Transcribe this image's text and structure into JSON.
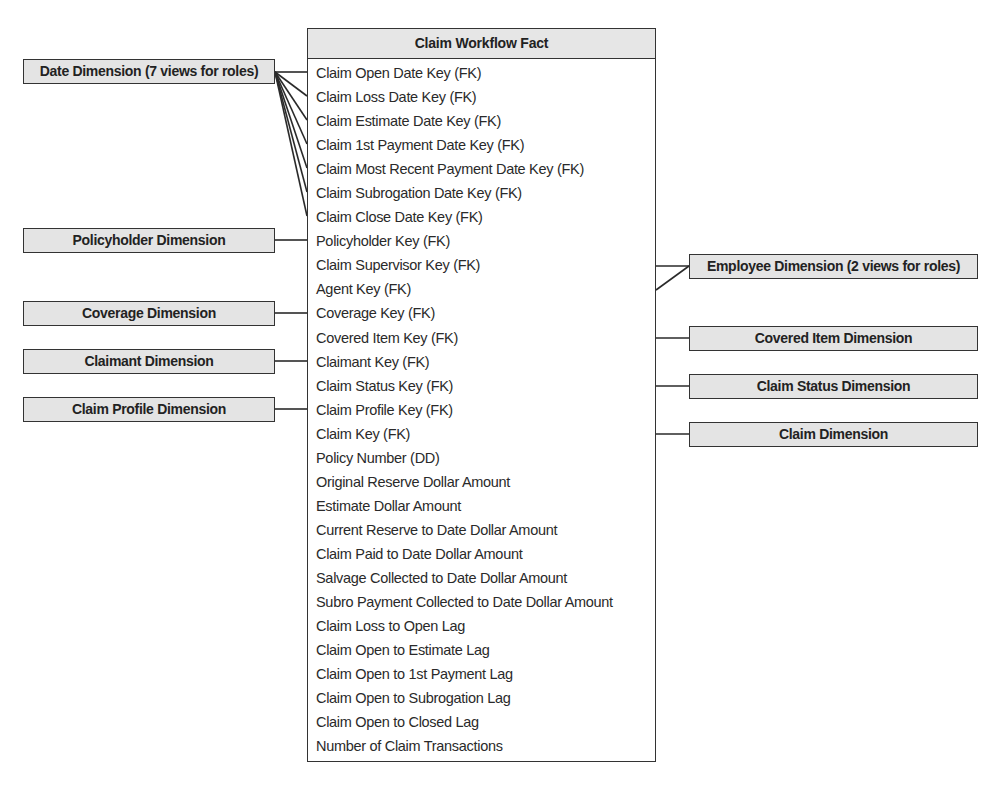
{
  "fact_table": {
    "title": "Claim Workflow Fact",
    "rows": [
      "Claim Open Date Key (FK)",
      "Claim Loss Date Key (FK)",
      "Claim Estimate Date Key (FK)",
      "Claim 1st Payment Date Key (FK)",
      "Claim Most Recent Payment Date Key (FK)",
      "Claim Subrogation Date Key (FK)",
      "Claim Close Date Key (FK)",
      "Policyholder Key (FK)",
      "Claim Supervisor Key (FK)",
      "Agent Key (FK)",
      "Coverage Key (FK)",
      "Covered Item Key (FK)",
      "Claimant Key (FK)",
      "Claim Status Key (FK)",
      "Claim Profile Key (FK)",
      "Claim Key (FK)",
      "Policy Number (DD)",
      "Original Reserve Dollar Amount",
      "Estimate Dollar Amount",
      "Current Reserve to Date Dollar Amount",
      "Claim Paid to Date Dollar Amount",
      "Salvage Collected to Date Dollar Amount",
      "Subro Payment Collected to Date Dollar Amount",
      "Claim Loss to Open Lag",
      "Claim Open to Estimate Lag",
      "Claim Open to 1st Payment Lag",
      "Claim Open to Subrogation Lag",
      "Claim Open to Closed Lag",
      "Number of Claim Transactions"
    ]
  },
  "left_dimensions": [
    {
      "label": "Date Dimension (7 views for roles)",
      "connects_to_rows": [
        0,
        1,
        2,
        3,
        4,
        5,
        6
      ]
    },
    {
      "label": "Policyholder Dimension",
      "connects_to_rows": [
        7
      ]
    },
    {
      "label": "Coverage Dimension",
      "connects_to_rows": [
        10
      ]
    },
    {
      "label": "Claimant Dimension",
      "connects_to_rows": [
        12
      ]
    },
    {
      "label": "Claim Profile Dimension",
      "connects_to_rows": [
        14
      ]
    }
  ],
  "right_dimensions": [
    {
      "label": "Employee Dimension (2 views for roles)",
      "connects_to_rows": [
        8,
        9
      ]
    },
    {
      "label": "Covered Item Dimension",
      "connects_to_rows": [
        11
      ]
    },
    {
      "label": "Claim Status Dimension",
      "connects_to_rows": [
        13
      ]
    },
    {
      "label": "Claim Dimension",
      "connects_to_rows": [
        15
      ]
    }
  ],
  "colors": {
    "box_fill": "#e4e4e4",
    "border": "#333333",
    "background": "#ffffff"
  }
}
